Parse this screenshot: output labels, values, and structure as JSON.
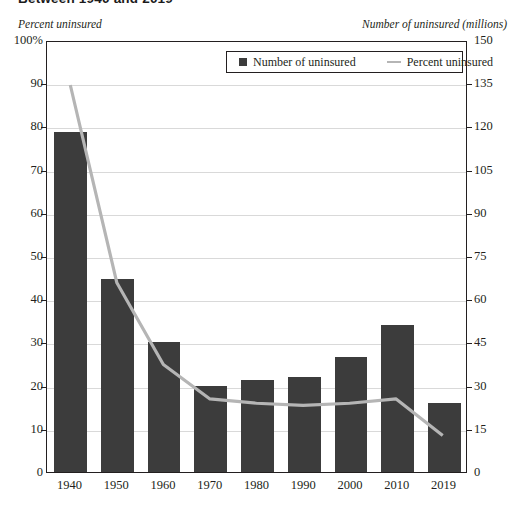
{
  "title": "Between 1940 and 2019",
  "captions": {
    "left": "Percent uninsured",
    "right": "Number of uninsured (millions)"
  },
  "legend": {
    "bar_label": "Number of uninsured",
    "line_label": "Percent uninsured",
    "bar_icon": "filled-square-icon",
    "line_icon": "horizontal-line-icon"
  },
  "colors": {
    "bar": "#3c3c3c",
    "line": "#b5b5b5",
    "grid": "#d9d9d9",
    "axis": "#231f20"
  },
  "axes": {
    "left_ticks": [
      "100%",
      "90",
      "80",
      "70",
      "60",
      "50",
      "40",
      "30",
      "20",
      "10",
      "0"
    ],
    "right_ticks": [
      "150",
      "135",
      "120",
      "105",
      "90",
      "75",
      "60",
      "45",
      "30",
      "15",
      "0"
    ],
    "left_label_suffix": "%"
  },
  "chart_data": {
    "type": "bar",
    "title": "Between 1940 and 2019",
    "xlabel": "",
    "ylabel": "Percent uninsured",
    "y2label": "Number of uninsured (millions)",
    "categories": [
      "1940",
      "1950",
      "1960",
      "1970",
      "1980",
      "1990",
      "2000",
      "2010",
      "2019"
    ],
    "ylim": [
      0,
      100
    ],
    "y2lim": [
      0,
      150
    ],
    "yticks": [
      0,
      10,
      20,
      30,
      40,
      50,
      60,
      70,
      80,
      90,
      100
    ],
    "y2ticks": [
      0,
      15,
      30,
      45,
      60,
      75,
      90,
      105,
      120,
      135,
      150
    ],
    "grid": true,
    "legend_position": "top-center",
    "series": [
      {
        "name": "Number of uninsured",
        "type": "bar",
        "axis": "right",
        "unit": "millions",
        "values": [
          118,
          67,
          45,
          30,
          32,
          33,
          40,
          51,
          24
        ]
      },
      {
        "name": "Percent uninsured",
        "type": "line",
        "axis": "left",
        "unit": "percent",
        "values": [
          90,
          44,
          25,
          17,
          16,
          15.5,
          16,
          17,
          8.5
        ]
      }
    ]
  }
}
